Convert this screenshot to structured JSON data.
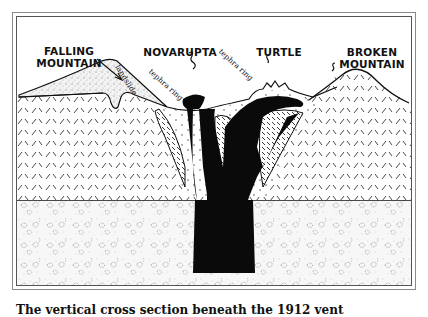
{
  "figure": {
    "title_labels": {
      "falling_mountain": "FALLING\nMOUNTAIN",
      "falling_mountain_line1": "FALLING",
      "falling_mountain_line2": "MOUNTAIN",
      "novarupta": "NOVARUPTA",
      "turtle": "TURTLE",
      "broken_mountain_line1": "BROKEN",
      "broken_mountain_line2": "MOUNTAIN"
    },
    "annotations": {
      "landslide": "landslide",
      "tephra_ring_left": "tephra ring",
      "tephra_ring_right": "tephra ring"
    },
    "layers": [
      {
        "name": "surface-deposits",
        "pattern": "fine-stipple"
      },
      {
        "name": "sedimentary-rock",
        "pattern": "dashed-crosshatch"
      },
      {
        "name": "basement-rock",
        "pattern": "speckled-blobs"
      },
      {
        "name": "magma-conduit",
        "pattern": "solid-black"
      },
      {
        "name": "welded-tuff",
        "pattern": "diagonal-hatch"
      }
    ],
    "colors": {
      "ink": "#111111",
      "background": "#ffffff",
      "frame": "#8a8a8a"
    }
  },
  "caption": "The vertical cross section beneath the 1912 vent"
}
